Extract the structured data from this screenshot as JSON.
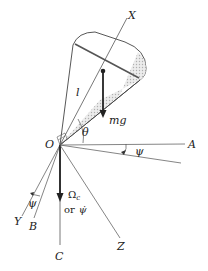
{
  "diagram": {
    "labels": {
      "X": "X",
      "Y": "Y",
      "Z": "Z",
      "A": "A",
      "B": "B",
      "C": "C",
      "O": "O",
      "l": "l",
      "theta": "θ",
      "psi_top": "ψ",
      "psi_bottom": "ψ",
      "mg": "mg",
      "omega_c": "Ω",
      "omega_c_sub": "c",
      "or_text": "or",
      "psi_dot": "ψ̇"
    },
    "colors": {
      "line": "#444444",
      "shading": "#c8c8c8",
      "background": "#ffffff"
    }
  }
}
